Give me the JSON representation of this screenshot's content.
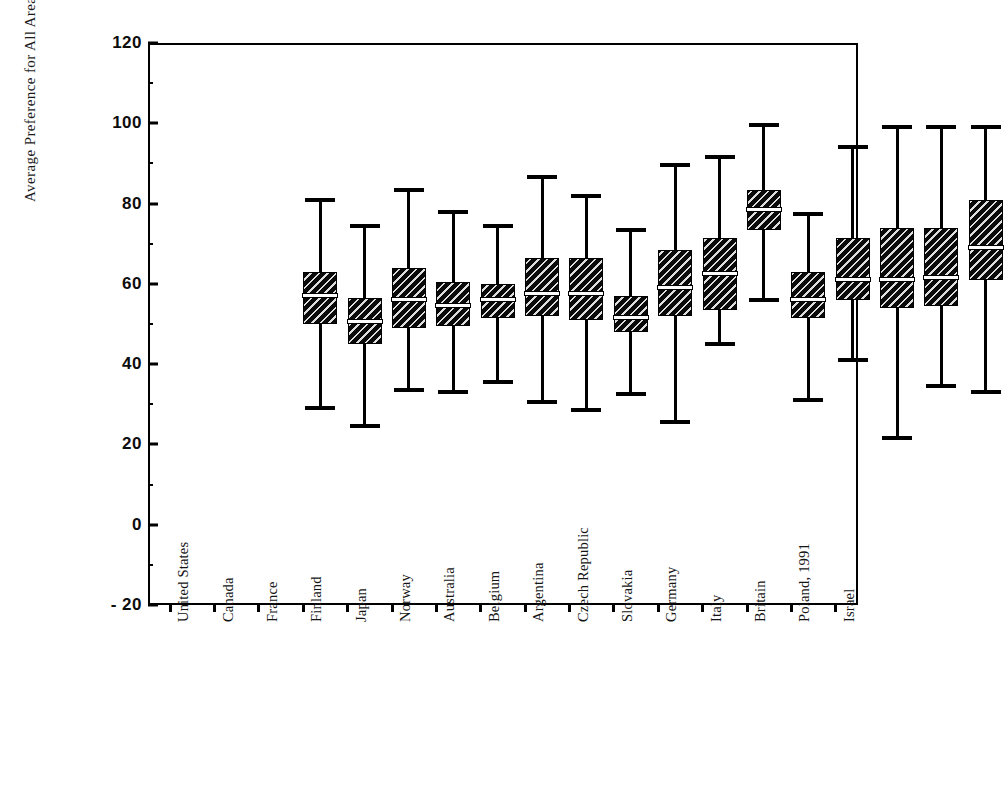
{
  "chart_data": {
    "type": "box",
    "title": "",
    "xlabel": "",
    "ylabel": "Average Preference for All Area",
    "ylim": [
      -20,
      120
    ],
    "yticks": [
      -20,
      0,
      20,
      40,
      60,
      80,
      100,
      120
    ],
    "ytick_labels": [
      "- 20",
      "0",
      "20",
      "40",
      "60",
      "80",
      "100",
      "120"
    ],
    "grid": false,
    "legend": "none",
    "categories": [
      "United States",
      "Canada",
      "France",
      "Finland",
      "Japan",
      "Norway",
      "Australia",
      "Belgium",
      "Argentina",
      "Czech Republic",
      "Slovakia",
      "Germany",
      "Italy",
      "Britain",
      "Poland, 1991",
      "Israel"
    ],
    "boxes": [
      {
        "label": "United States",
        "whisker_low": 30.0,
        "q1": 50.5,
        "median": 58.0,
        "q3": 63.5,
        "whisker_high": 82.0
      },
      {
        "label": "Canada",
        "whisker_low": 25.5,
        "q1": 45.5,
        "median": 51.5,
        "q3": 57.0,
        "whisker_high": 75.5
      },
      {
        "label": "France",
        "whisker_low": 34.5,
        "q1": 49.5,
        "median": 57.0,
        "q3": 64.5,
        "whisker_high": 84.5
      },
      {
        "label": "Finland",
        "whisker_low": 34.0,
        "q1": 50.0,
        "median": 55.5,
        "q3": 61.0,
        "whisker_high": 79.0
      },
      {
        "label": "Japan",
        "whisker_low": 36.5,
        "q1": 52.0,
        "median": 57.0,
        "q3": 60.5,
        "whisker_high": 75.5
      },
      {
        "label": "Norway",
        "whisker_low": 31.5,
        "q1": 52.5,
        "median": 58.5,
        "q3": 67.0,
        "whisker_high": 87.5
      },
      {
        "label": "Australia",
        "whisker_low": 29.5,
        "q1": 51.5,
        "median": 58.5,
        "q3": 67.0,
        "whisker_high": 83.0
      },
      {
        "label": "Belgium",
        "whisker_low": 33.5,
        "q1": 48.5,
        "median": 52.5,
        "q3": 57.5,
        "whisker_high": 74.5
      },
      {
        "label": "Argentina",
        "whisker_low": 26.5,
        "q1": 52.5,
        "median": 60.0,
        "q3": 69.0,
        "whisker_high": 90.5
      },
      {
        "label": "Czech Republic",
        "whisker_low": 46.0,
        "q1": 54.0,
        "median": 63.5,
        "q3": 72.0,
        "whisker_high": 92.5
      },
      {
        "label": "Slovakia",
        "whisker_low": 57.0,
        "q1": 74.0,
        "median": 79.5,
        "q3": 84.0,
        "whisker_high": 100.5
      },
      {
        "label": "Germany",
        "whisker_low": 32.0,
        "q1": 52.0,
        "median": 57.0,
        "q3": 63.5,
        "whisker_high": 78.5
      },
      {
        "label": "Italy",
        "whisker_low": 42.0,
        "q1": 56.5,
        "median": 62.0,
        "q3": 72.0,
        "whisker_high": 95.0
      },
      {
        "label": "Britain",
        "whisker_low": 22.5,
        "q1": 54.5,
        "median": 62.0,
        "q3": 74.5,
        "whisker_high": 100.0
      },
      {
        "label": "Poland, 1991",
        "whisker_low": 35.5,
        "q1": 55.0,
        "median": 62.5,
        "q3": 74.5,
        "whisker_high": 100.0
      },
      {
        "label": "Israel",
        "whisker_low": 34.0,
        "q1": 61.5,
        "median": 70.0,
        "q3": 81.5,
        "whisker_high": 100.0
      }
    ]
  }
}
